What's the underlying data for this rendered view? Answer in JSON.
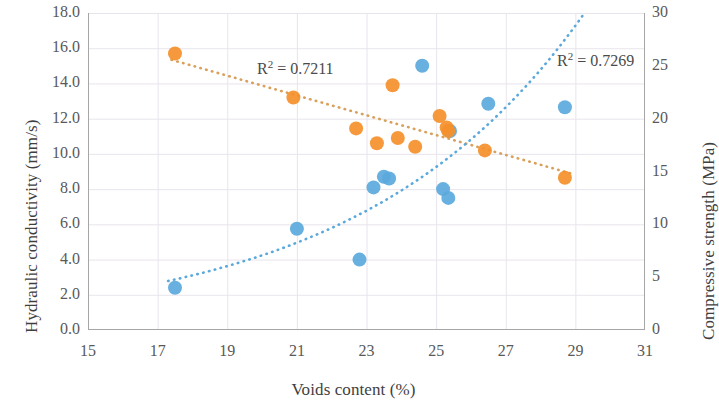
{
  "chart_data": {
    "type": "scatter",
    "title": "",
    "xlabel": "Voids content (%)",
    "xlim": [
      15,
      31
    ],
    "xticks": [
      15,
      17,
      19,
      21,
      23,
      25,
      27,
      29,
      31
    ],
    "grid": true,
    "legend": "none",
    "axes": [
      {
        "id": "left",
        "ylabel": "Hydraulic conductivity (mm/s)",
        "ylim": [
          0.0,
          18.0
        ],
        "yticks": [
          "0.0",
          "2.0",
          "4.0",
          "6.0",
          "8.0",
          "10.0",
          "12.0",
          "14.0",
          "16.0",
          "18.0"
        ]
      },
      {
        "id": "right",
        "ylabel": "Compressive strength (MPa)",
        "ylim": [
          0,
          30
        ],
        "yticks": [
          "0",
          "5",
          "10",
          "15",
          "20",
          "25",
          "30"
        ]
      }
    ],
    "series": [
      {
        "name": "Hydraulic conductivity",
        "axis": "left",
        "color": "#5BA9DC",
        "marker": "circle",
        "trendline": {
          "type": "exponential",
          "style": "dotted",
          "color": "#5BA9DC",
          "r2_label": "R² = 0.7269",
          "r2": 0.7269
        },
        "points": [
          {
            "x": 17.5,
            "y": 2.4
          },
          {
            "x": 21.0,
            "y": 5.75
          },
          {
            "x": 22.8,
            "y": 4.0
          },
          {
            "x": 23.2,
            "y": 8.1
          },
          {
            "x": 23.5,
            "y": 8.7
          },
          {
            "x": 23.65,
            "y": 8.6
          },
          {
            "x": 24.6,
            "y": 15.0
          },
          {
            "x": 25.2,
            "y": 8.0
          },
          {
            "x": 25.35,
            "y": 7.5
          },
          {
            "x": 25.4,
            "y": 11.3
          },
          {
            "x": 26.5,
            "y": 12.85
          },
          {
            "x": 28.7,
            "y": 12.65
          }
        ]
      },
      {
        "name": "Compressive strength",
        "axis": "left",
        "color": "#F4902B",
        "marker": "circle",
        "trendline": {
          "type": "linear",
          "style": "dotted",
          "color": "#D98B3C",
          "r2_label": "R² = 0.7211",
          "r2": 0.7211
        },
        "points": [
          {
            "x": 17.5,
            "y": 15.7
          },
          {
            "x": 20.9,
            "y": 13.2
          },
          {
            "x": 22.7,
            "y": 11.45
          },
          {
            "x": 23.3,
            "y": 10.6
          },
          {
            "x": 23.75,
            "y": 13.9
          },
          {
            "x": 23.9,
            "y": 10.9
          },
          {
            "x": 24.4,
            "y": 10.4
          },
          {
            "x": 25.1,
            "y": 12.15
          },
          {
            "x": 25.3,
            "y": 11.5
          },
          {
            "x": 25.35,
            "y": 11.3
          },
          {
            "x": 26.4,
            "y": 10.2
          },
          {
            "x": 28.7,
            "y": 8.65
          }
        ]
      }
    ]
  },
  "annotations": {
    "r2_orange": "R² = 0.7211",
    "r2_blue": "R² = 0.7269"
  },
  "colors": {
    "blue": "#5BA9DC",
    "orange": "#F4902B",
    "orange_trend": "#D9A05B",
    "grid": "#E8E4EC",
    "axis": "#A6A6A6",
    "text": "#595959"
  }
}
